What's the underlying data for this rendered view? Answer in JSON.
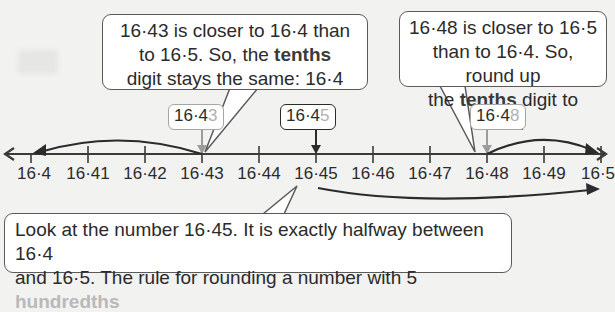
{
  "callouts": {
    "left": {
      "line1": "16·43 is closer to 16·4 than",
      "line2a": "to 16·5. So, the ",
      "line2b": "tenths",
      "line3": "digit stays the same: 16·4"
    },
    "right": {
      "line1": "16·48 is closer to 16·5",
      "line2": "than to 16·4. So, round up",
      "line3a": "the ",
      "line3b": "tenths",
      "line3c": " digit to 16·5."
    },
    "bottom": {
      "line1": "Look at the number 16·45. It is exactly halfway between 16·4",
      "line2a": "and 16·5. The rule for rounding a number with 5 ",
      "line2b": "hundredths"
    }
  },
  "tags": [
    {
      "prefix": "16·4",
      "last": "3"
    },
    {
      "prefix": "16·4",
      "last": "5"
    },
    {
      "prefix": "16·4",
      "last": "8"
    }
  ],
  "number_line": {
    "ticks": [
      "16·4",
      "16·41",
      "16·42",
      "16·43",
      "16·44",
      "16·45",
      "16·46",
      "16·47",
      "16·48",
      "16·49",
      "16·5"
    ]
  },
  "colors": {
    "line": "#3a3a3a",
    "grey_arrow": "#9c9c9c",
    "highlight_digit": "#b0b0b0",
    "background": "#f2f2f1"
  }
}
